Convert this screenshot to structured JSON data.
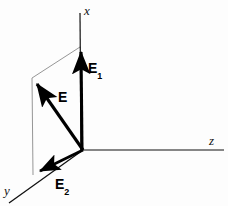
{
  "figure": {
    "background_color": "#fdfdfd",
    "stroke_color": "#000000",
    "thin_line_color": "#777777",
    "width": 228,
    "height": 206
  },
  "axes": [
    {
      "id": "x",
      "label": "x",
      "direction": "up",
      "origin": [
        83,
        150
      ],
      "tip": [
        80,
        14
      ]
    },
    {
      "id": "y",
      "label": "y",
      "direction": "down-left",
      "origin": [
        83,
        150
      ],
      "tip": [
        10,
        202
      ]
    },
    {
      "id": "z",
      "label": "z",
      "direction": "right",
      "origin": [
        83,
        150
      ],
      "tip": [
        224,
        150
      ]
    }
  ],
  "vectors": [
    {
      "id": "E",
      "label": "E",
      "subscript": "",
      "origin": [
        83,
        150
      ],
      "tip": [
        32,
        78
      ],
      "description": "resultant vector"
    },
    {
      "id": "E1",
      "label": "E",
      "subscript": "1",
      "origin": [
        83,
        150
      ],
      "tip": [
        81,
        46
      ],
      "description": "component along x axis"
    },
    {
      "id": "E2",
      "label": "E",
      "subscript": "2",
      "origin": [
        83,
        150
      ],
      "tip": [
        33,
        175
      ],
      "description": "component along y axis"
    }
  ],
  "construction_lines": [
    {
      "id": "parallel-top",
      "from": [
        80,
        47
      ],
      "to": [
        32,
        78
      ],
      "style": "thin"
    },
    {
      "id": "parallel-side",
      "from": [
        32,
        78
      ],
      "to": [
        33,
        175
      ],
      "style": "thin"
    }
  ],
  "labels": {
    "axis_x": "x",
    "axis_y": "y",
    "axis_z": "z",
    "vector_e": "E",
    "vector_e1_base": "E",
    "vector_e1_sub": "1",
    "vector_e2_base": "E",
    "vector_e2_sub": "2"
  }
}
